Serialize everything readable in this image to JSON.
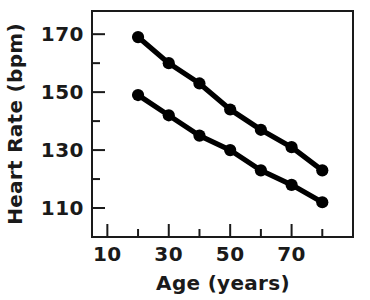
{
  "chart_data": {
    "type": "line",
    "title": "",
    "xlabel": "Age (years)",
    "ylabel": "Heart Rate (bpm)",
    "x": [
      20,
      30,
      40,
      50,
      60,
      70,
      80
    ],
    "series": [
      {
        "name": "upper",
        "values": [
          169,
          160,
          153,
          144,
          137,
          131,
          123
        ]
      },
      {
        "name": "lower",
        "values": [
          149,
          142,
          135,
          130,
          123,
          118,
          112
        ]
      }
    ],
    "xlim": [
      5,
      90
    ],
    "ylim": [
      100,
      178
    ],
    "xticks": [
      10,
      30,
      50,
      70
    ],
    "xticklabels": [
      "10",
      "30",
      "50",
      "70"
    ],
    "xminorticks": [
      20,
      40,
      60,
      80
    ],
    "yticks": [
      110,
      130,
      150,
      170
    ],
    "yticklabels": [
      "110",
      "130",
      "150",
      "170"
    ],
    "yminorticks": [
      120,
      140,
      160
    ],
    "grid": false,
    "legend": "none",
    "marker_color": "#000000",
    "line_color": "#000000",
    "axis_color": "#1a1a1a",
    "background": "#ffffff"
  },
  "axes": {
    "x_title": "Age (years)",
    "y_title": "Heart Rate (bpm)"
  },
  "xtick_labels": [
    "10",
    "30",
    "50",
    "70"
  ],
  "ytick_labels": [
    "110",
    "130",
    "150",
    "170"
  ]
}
